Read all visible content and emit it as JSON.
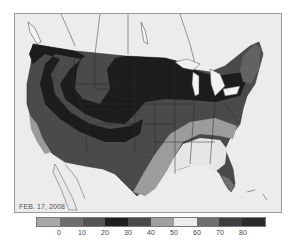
{
  "map": {
    "title_date": "FEB. 17, 2008",
    "region": "Contiguous United States",
    "background_color": "#ebebeb",
    "zones": [
      {
        "name": "northwest-northern-plains-great-lakes-core",
        "bin": "20-30",
        "color": "#1c1c1c"
      },
      {
        "name": "central-rockies-band",
        "bin": "10-20",
        "color": "#4a4a4a"
      },
      {
        "name": "northern-rockies-interior",
        "bin": "10-20",
        "color": "#4e4e4e"
      },
      {
        "name": "southwest-plains",
        "bin": "30-40",
        "color": "#3a3a3a"
      },
      {
        "name": "california-coast",
        "bin": "0-10",
        "color": "#5e5e5e"
      },
      {
        "name": "southern-coast-band",
        "bin": "40-50",
        "color": "#9a9a9a"
      },
      {
        "name": "deep-south",
        "bin": "50-60",
        "color": "#e4e4e4"
      },
      {
        "name": "florida-south",
        "bin": "60-70",
        "color": "#707070"
      },
      {
        "name": "new-england",
        "bin": "0-10",
        "color": "#606060"
      }
    ]
  },
  "legend": {
    "swatches": [
      {
        "color": "#a8a8a8"
      },
      {
        "color": "#6e6e6e"
      },
      {
        "color": "#545454"
      },
      {
        "color": "#1e1e1e"
      },
      {
        "color": "#4a4a4a"
      },
      {
        "color": "#a0a0a0"
      },
      {
        "color": "#ececec"
      },
      {
        "color": "#707070"
      },
      {
        "color": "#3e3e3e"
      },
      {
        "color": "#2a2a2a"
      }
    ],
    "ticks": [
      "0",
      "10",
      "20",
      "30",
      "40",
      "50",
      "60",
      "70",
      "80"
    ]
  }
}
